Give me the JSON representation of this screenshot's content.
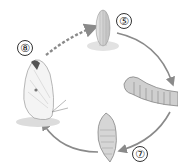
{
  "diagram": {
    "type": "life-cycle",
    "stages": [
      {
        "id": "egg",
        "label": "⑤"
      },
      {
        "id": "caterpillar",
        "label": ""
      },
      {
        "id": "pupa",
        "label": "⑦"
      },
      {
        "id": "butterfly",
        "label": "⑧"
      }
    ],
    "arrows": [
      {
        "from": "butterfly",
        "to": "egg",
        "style": "dashed"
      },
      {
        "from": "egg",
        "to": "caterpillar",
        "style": "solid"
      },
      {
        "from": "caterpillar",
        "to": "pupa",
        "style": "solid"
      },
      {
        "from": "pupa",
        "to": "butterfly",
        "style": "solid"
      }
    ],
    "colors": {
      "arrow": "#8a8a8a",
      "ink": "#555555"
    }
  }
}
